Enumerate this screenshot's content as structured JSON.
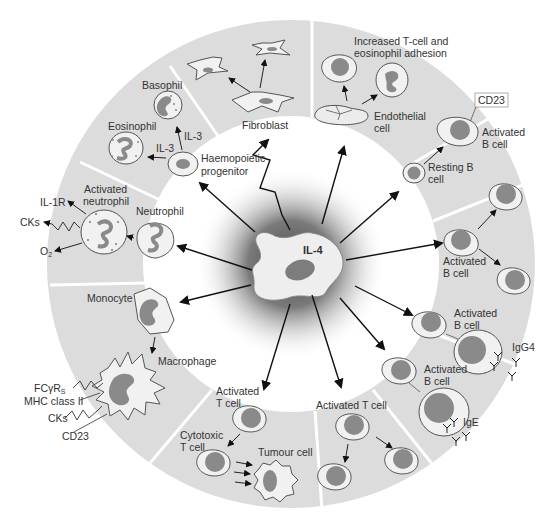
{
  "diagram": {
    "center": {
      "label": "IL-4"
    },
    "colors": {
      "ring": "#dcdcdc",
      "divider": "#ffffff",
      "cell_fill": "#f1f1f1",
      "nucleus": "#8a8a8a",
      "halo": "#6e6e6e"
    },
    "segments": [
      {
        "id": "fibroblast",
        "labels": {
          "main": "Fibroblast"
        }
      },
      {
        "id": "endothelial",
        "labels": {
          "title_line1": "Increased T-cell and",
          "title_line2": "eosinophil adhesion",
          "cell_line1": "Endothelial",
          "cell_line2": "cell"
        }
      },
      {
        "id": "resting-b",
        "labels": {
          "marker": "CD23",
          "activated_line1": "Activated",
          "activated_line2": "B cell",
          "resting_line1": "Resting B",
          "resting_line2": "cell"
        }
      },
      {
        "id": "b-proliferation",
        "labels": {
          "line1": "Activated",
          "line2": "B cell"
        }
      },
      {
        "id": "b-class-switch",
        "labels": {
          "b1_line1": "Activated",
          "b1_line2": "B cell",
          "igg4": "IgG4",
          "b2_line1": "Activated",
          "b2_line2": "B cell",
          "ige": "IgE"
        }
      },
      {
        "id": "t-proliferation",
        "labels": {
          "main": "Activated T cell"
        }
      },
      {
        "id": "cytotoxic",
        "labels": {
          "act_line1": "Activated",
          "act_line2": "T cell",
          "cyto_line1": "Cytotoxic",
          "cyto_line2": "T cell",
          "tumour": "Tumour cell"
        }
      },
      {
        "id": "monocyte",
        "labels": {
          "monocyte": "Monocyte",
          "macrophage": "Macrophage",
          "fcr": "FCγR",
          "fcr_sub": "S",
          "mhc": "MHC class II",
          "cks": "CKs",
          "cd23": "CD23"
        }
      },
      {
        "id": "neutrophil",
        "labels": {
          "il1r": "IL-1R",
          "activated_line1": "Activated",
          "activated_line2": "neutrophil",
          "neutrophil": "Neutrophil",
          "cks": "CKs",
          "o2": "O",
          "o2_sub": "2"
        }
      },
      {
        "id": "haemopoietic",
        "labels": {
          "basophil": "Basophil",
          "eosinophil": "Eosinophil",
          "il3_a": "IL-3",
          "il3_b": "IL-3",
          "prog_line1": "Haemopoietic",
          "prog_line2": "progenitor"
        }
      }
    ]
  }
}
